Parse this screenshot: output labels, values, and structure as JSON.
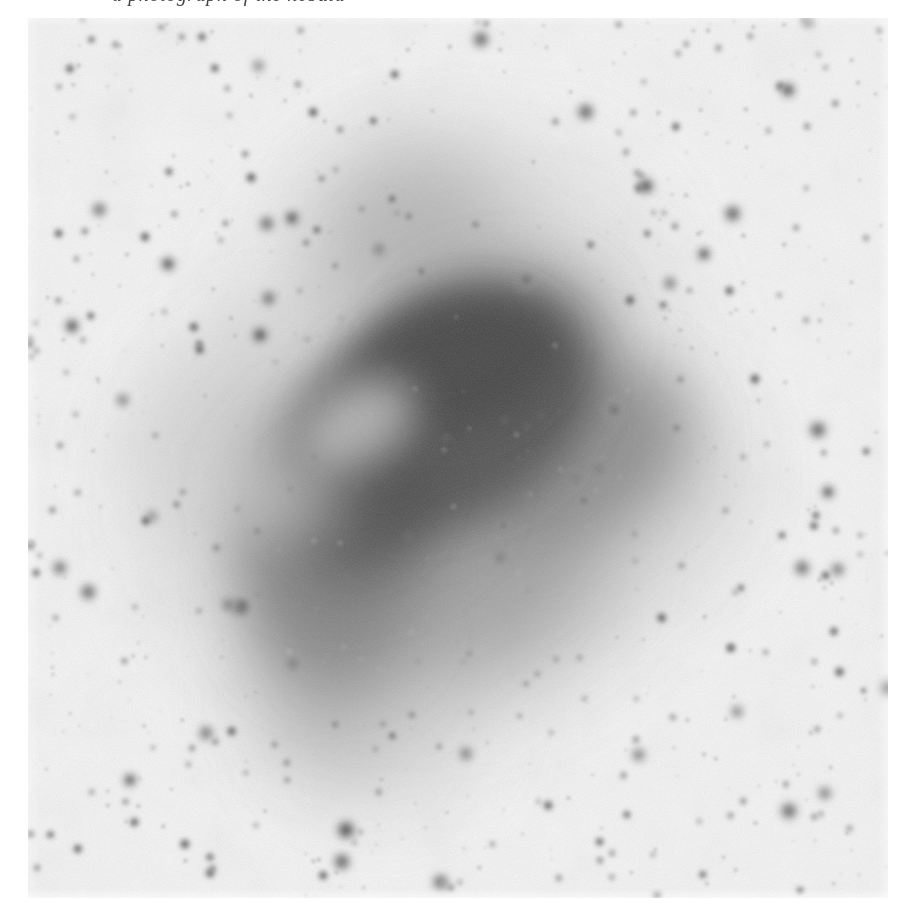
{
  "page": {
    "width": 904,
    "height": 905,
    "background_color": "#ffffff"
  },
  "caption": {
    "text": "a photograph of the nebula",
    "note": "clipped by top edge of frame; only descenders visible",
    "visible_fragment": "descenders only",
    "color": "#2b2b2b"
  },
  "plate": {
    "name": "astronomical-photographic-plate",
    "kind": "negative",
    "description": "Photographic negative of a bipolar/dark nebula embedded in a dense Milky Way star field. Stars render as dark fuzzy blobs on a pale grey emulsion background.",
    "paper_color": "#ffffff",
    "sky_background_color": "#f2f2f2",
    "nebula_core_color": "#474747",
    "nebula_mid_color": "#7d7d7d",
    "nebula_halo_color": "#c6c6c6",
    "star_color": "#4a4a4a",
    "grain": "fine silver-halide emulsion grain",
    "frame": {
      "left": 28,
      "top": 18,
      "width": 860,
      "height": 880
    }
  },
  "chart_data": {
    "type": "scatter",
    "title": "",
    "xlabel": "",
    "ylabel": "",
    "xlim": [
      0,
      860
    ],
    "ylim": [
      0,
      880
    ],
    "grid": false,
    "legend": "none",
    "nebula_blobs": [
      {
        "cx": 415,
        "cy": 395,
        "rx": 150,
        "ry": 105,
        "rot": -20,
        "tone": "#4c4c4c",
        "blur": 26
      },
      {
        "cx": 330,
        "cy": 470,
        "rx": 120,
        "ry": 100,
        "rot": -25,
        "tone": "#5e5e5e",
        "blur": 28
      },
      {
        "cx": 470,
        "cy": 330,
        "rx": 105,
        "ry": 75,
        "rot": -12,
        "tone": "#555555",
        "blur": 24
      },
      {
        "cx": 300,
        "cy": 560,
        "rx": 85,
        "ry": 105,
        "rot": -8,
        "tone": "#6d6d6d",
        "blur": 30
      },
      {
        "cx": 530,
        "cy": 430,
        "rx": 130,
        "ry": 90,
        "rot": -18,
        "tone": "#6a6a6a",
        "blur": 32
      },
      {
        "cx": 385,
        "cy": 215,
        "rx": 95,
        "ry": 95,
        "rot": 0,
        "tone": "#9a9a9a",
        "blur": 34
      },
      {
        "cx": 300,
        "cy": 660,
        "rx": 70,
        "ry": 90,
        "rot": 0,
        "tone": "#9e9e9e",
        "blur": 34
      },
      {
        "cx": 215,
        "cy": 420,
        "rx": 110,
        "ry": 90,
        "rot": -30,
        "tone": "#a6a6a6",
        "blur": 36
      },
      {
        "cx": 600,
        "cy": 470,
        "rx": 110,
        "ry": 85,
        "rot": -15,
        "tone": "#aeaeae",
        "blur": 38
      },
      {
        "cx": 420,
        "cy": 560,
        "rx": 150,
        "ry": 105,
        "rot": -10,
        "tone": "#8c8c8c",
        "blur": 34
      },
      {
        "cx": 430,
        "cy": 300,
        "rx": 190,
        "ry": 150,
        "rot": -15,
        "tone": "#bdbdbd",
        "blur": 44
      },
      {
        "cx": 400,
        "cy": 480,
        "rx": 260,
        "ry": 210,
        "rot": -18,
        "tone": "#cacaca",
        "blur": 52
      },
      {
        "cx": 360,
        "cy": 700,
        "rx": 90,
        "ry": 80,
        "rot": 0,
        "tone": "#d2d2d2",
        "blur": 40
      }
    ],
    "bright_stars": [
      {
        "x": 318,
        "y": 812,
        "r": 13
      },
      {
        "x": 232,
        "y": 317,
        "r": 11
      },
      {
        "x": 618,
        "y": 168,
        "r": 11
      },
      {
        "x": 862,
        "y": 670,
        "r": 12
      },
      {
        "x": 140,
        "y": 246,
        "r": 10
      },
      {
        "x": 498,
        "y": 262,
        "r": 10
      },
      {
        "x": 264,
        "y": 200,
        "r": 10
      },
      {
        "x": 586,
        "y": 392,
        "r": 10
      },
      {
        "x": 214,
        "y": 588,
        "r": 10
      },
      {
        "x": 760,
        "y": 72,
        "r": 10
      },
      {
        "x": 44,
        "y": 308,
        "r": 10
      },
      {
        "x": 800,
        "y": 474,
        "r": 9
      },
      {
        "x": 676,
        "y": 236,
        "r": 9
      },
      {
        "x": 102,
        "y": 762,
        "r": 9
      }
    ],
    "star_count_estimate": 720,
    "values": [],
    "categories": []
  }
}
